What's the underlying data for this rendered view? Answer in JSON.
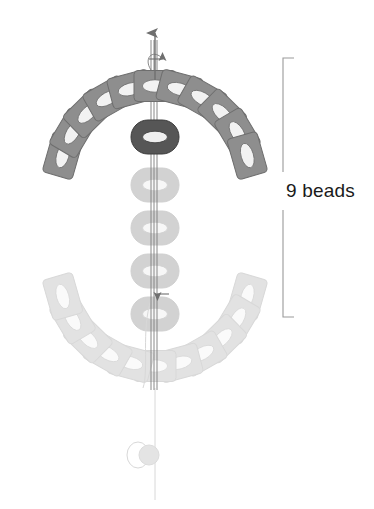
{
  "diagram": {
    "type": "beading-instruction-diagram",
    "title_text": "9 beads",
    "annotation": {
      "label": "9 beads",
      "bracket": {
        "x": 283,
        "y_top": 58,
        "y_bottom": 317,
        "gap_top": 172,
        "gap_bottom": 210,
        "tick_length": 11,
        "color": "#9a9a9a"
      }
    },
    "colors": {
      "bead_active": "#565656",
      "bead_active_edge": "#3c3c3c",
      "bead_arc": "#8e8e8e",
      "bead_arc_edge": "#6e6e6e",
      "bead_hole": "#f2f2f2",
      "ghost_light": "#e2e2e2",
      "ghost_mid": "#d2d2d2",
      "thread": "#7a7a7a",
      "thread_faint": "#d8d8d8",
      "text": "#1a1a1a",
      "background": "#ffffff"
    },
    "thread": {
      "axis_x": 155,
      "arrow_tip_y": 33,
      "arrow_label": "up-arrow",
      "bottom_y": 500,
      "knot": {
        "cx": 142,
        "cy": 455,
        "r": 11
      }
    },
    "active_bead": {
      "cx": 155,
      "cy": 137,
      "w": 48,
      "h": 34,
      "label": "dark-bead"
    },
    "column_ghost_beads": [
      {
        "cx": 155,
        "cy": 185
      },
      {
        "cx": 155,
        "cy": 228
      },
      {
        "cx": 155,
        "cy": 271
      },
      {
        "cx": 155,
        "cy": 314
      }
    ],
    "arc_right": {
      "count": 11,
      "center_x": 155,
      "center_y": 182,
      "radius": 96,
      "start_angle_deg": -74,
      "end_angle_deg": 74,
      "bead_w": 42,
      "bead_h": 31,
      "label": "right-bead-arc"
    },
    "arc_left_ghost": {
      "count": 11,
      "center_x": 155,
      "center_y": 270,
      "radius": 96,
      "start_angle_deg": 106,
      "end_angle_deg": 254,
      "bead_w": 42,
      "bead_h": 31,
      "label": "left-ghost-bead-arc"
    },
    "arrow_markers": [
      {
        "name": "thread-up-arrow",
        "x": 155,
        "y": 33,
        "direction": "up"
      },
      {
        "name": "loop-start-arrow",
        "x": 161,
        "y": 59,
        "direction": "right"
      },
      {
        "name": "loop-end-arrow",
        "x": 159,
        "y": 294,
        "direction": "left"
      }
    ]
  }
}
